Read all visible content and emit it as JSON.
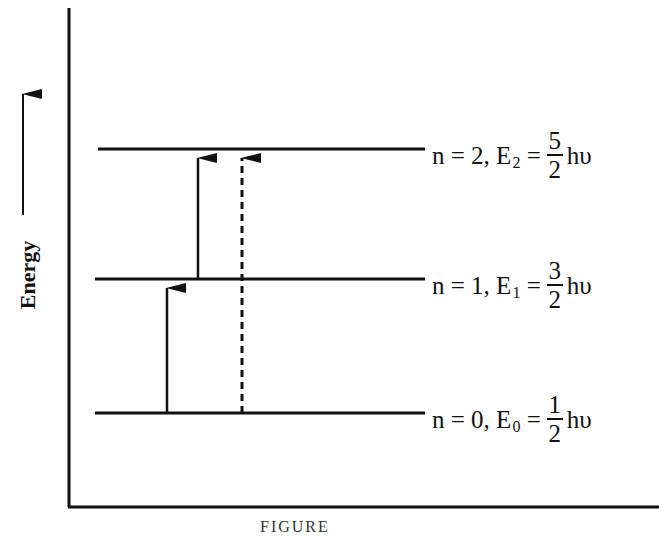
{
  "axis": {
    "y_label": "Energy",
    "y_arrow": "up-arrow"
  },
  "levels": [
    {
      "n_text": "n = 2,",
      "e_symbol": "E",
      "e_sub": "2",
      "equals": "=",
      "numerator": "5",
      "denominator": "2",
      "unit": "hυ"
    },
    {
      "n_text": "n = 1,",
      "e_symbol": "E",
      "e_sub": "1",
      "equals": "=",
      "numerator": "3",
      "denominator": "2",
      "unit": "hυ"
    },
    {
      "n_text": "n = 0,",
      "e_symbol": "E",
      "e_sub": "0",
      "equals": "=",
      "numerator": "1",
      "denominator": "2",
      "unit": "hυ"
    }
  ],
  "transitions": [
    {
      "from": "n=0",
      "to": "n=1",
      "style": "solid"
    },
    {
      "from": "n=1",
      "to": "n=2",
      "style": "solid"
    },
    {
      "from": "n=0",
      "to": "n=2",
      "style": "dashed"
    }
  ],
  "caption": "FIGURE"
}
